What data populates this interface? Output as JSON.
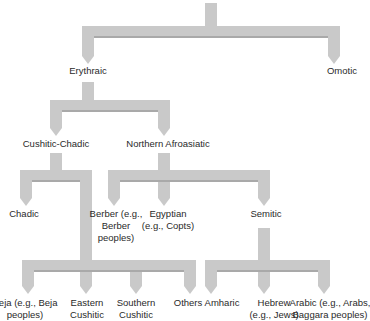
{
  "diagram": {
    "type": "language family tree",
    "colors": {
      "branch_fill": "#c9c9c9",
      "branch_shadow": "#a9a9a9",
      "text": "#2a2a2a"
    },
    "root": {
      "label": ""
    },
    "level1": {
      "erythraic": "Erythraic",
      "omotic": "Omotic"
    },
    "level2": {
      "cushitic_chadic": "Cushitic-Chadic",
      "northern_afroasiatic": "Northern Afroasiatic"
    },
    "level3": {
      "chadic": "Chadic",
      "berber": [
        "Berber (e.g.,",
        "Berber",
        "peoples)"
      ],
      "egyptian": [
        "Egyptian",
        "(e.g., Copts)"
      ],
      "semitic": "Semitic"
    },
    "cushitic_leaves": {
      "beja": [
        "Beja (e.g., Beja",
        "peoples)"
      ],
      "eastern": [
        "Eastern",
        "Cushitic"
      ],
      "southern": [
        "Southern",
        "Cushitic"
      ],
      "others": "Others"
    },
    "semitic_leaves": {
      "amharic": "Amharic",
      "hebrew": [
        "Hebrew",
        "(e.g., Jews)"
      ],
      "arabic": [
        "Arabic (e.g., Arabs,",
        "Baggara peoples)"
      ]
    }
  }
}
